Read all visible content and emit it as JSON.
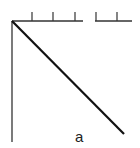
{
  "diagram": {
    "label": "a",
    "top_axis": {
      "tick_count": 5,
      "has_gap": true
    },
    "colors": {
      "line": "#111111",
      "axis": "#333333",
      "background": "#ffffff"
    }
  }
}
